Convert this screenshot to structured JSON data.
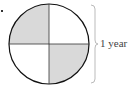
{
  "diagram": {
    "type": "quartered-circle",
    "quadrants": [
      {
        "position": "top-left",
        "shaded": true
      },
      {
        "position": "top-right",
        "shaded": false
      },
      {
        "position": "bottom-left",
        "shaded": false
      },
      {
        "position": "bottom-right",
        "shaded": true
      }
    ],
    "bracket_label": "1 year",
    "colors": {
      "shade": "#d9d9d9",
      "stroke": "#111111",
      "bracket": "#aaaaaa"
    }
  }
}
